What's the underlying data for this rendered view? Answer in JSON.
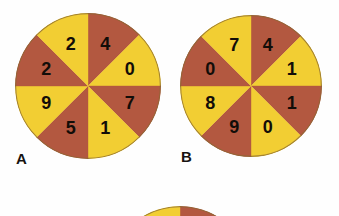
{
  "figure": {
    "background_color": "#fefefe",
    "sector_yellow": "#f2ce33",
    "sector_red": "#b35840",
    "outline_color": "#8a6a34",
    "label_color": "#120d08"
  },
  "spinners": [
    {
      "caption": "A",
      "center_x": 88,
      "center_y": 86,
      "radius": 73,
      "sector_count": 8,
      "sectors": [
        {
          "index": 0,
          "start_angle": 0,
          "end_angle": 45,
          "color": "#b35840",
          "value": "4"
        },
        {
          "index": 1,
          "start_angle": 45,
          "end_angle": 90,
          "color": "#f2ce33",
          "value": "0"
        },
        {
          "index": 2,
          "start_angle": 90,
          "end_angle": 135,
          "color": "#b35840",
          "value": "7"
        },
        {
          "index": 3,
          "start_angle": 135,
          "end_angle": 180,
          "color": "#f2ce33",
          "value": "1"
        },
        {
          "index": 4,
          "start_angle": 180,
          "end_angle": 225,
          "color": "#b35840",
          "value": "5"
        },
        {
          "index": 5,
          "start_angle": 225,
          "end_angle": 270,
          "color": "#f2ce33",
          "value": "9"
        },
        {
          "index": 6,
          "start_angle": 270,
          "end_angle": 315,
          "color": "#b35840",
          "value": "2"
        },
        {
          "index": 7,
          "start_angle": 315,
          "end_angle": 360,
          "color": "#f2ce33",
          "value": "2"
        }
      ]
    },
    {
      "caption": "B",
      "center_x": 251,
      "center_y": 86,
      "radius": 71,
      "sector_count": 8,
      "sectors": [
        {
          "index": 0,
          "start_angle": 0,
          "end_angle": 45,
          "color": "#b35840",
          "value": "4"
        },
        {
          "index": 1,
          "start_angle": 45,
          "end_angle": 90,
          "color": "#f2ce33",
          "value": "1"
        },
        {
          "index": 2,
          "start_angle": 90,
          "end_angle": 135,
          "color": "#b35840",
          "value": "1"
        },
        {
          "index": 3,
          "start_angle": 135,
          "end_angle": 180,
          "color": "#f2ce33",
          "value": "0"
        },
        {
          "index": 4,
          "start_angle": 180,
          "end_angle": 225,
          "color": "#b35840",
          "value": "9"
        },
        {
          "index": 5,
          "start_angle": 225,
          "end_angle": 270,
          "color": "#f2ce33",
          "value": "8"
        },
        {
          "index": 6,
          "start_angle": 270,
          "end_angle": 315,
          "color": "#b35840",
          "value": "0"
        },
        {
          "index": 7,
          "start_angle": 315,
          "end_angle": 360,
          "color": "#f2ce33",
          "value": "7"
        }
      ]
    },
    {
      "caption": "",
      "center_x": 180,
      "center_y": 278,
      "radius": 72,
      "sector_count": 8,
      "partially_visible": true,
      "sectors": [
        {
          "index": 0,
          "start_angle": 0,
          "end_angle": 45,
          "color": "#b35840",
          "value": ""
        },
        {
          "index": 1,
          "start_angle": 45,
          "end_angle": 90,
          "color": "#f2ce33",
          "value": ""
        },
        {
          "index": 2,
          "start_angle": 90,
          "end_angle": 135,
          "color": "#b35840",
          "value": ""
        },
        {
          "index": 3,
          "start_angle": 135,
          "end_angle": 180,
          "color": "#f2ce33",
          "value": ""
        },
        {
          "index": 4,
          "start_angle": 180,
          "end_angle": 225,
          "color": "#b35840",
          "value": ""
        },
        {
          "index": 5,
          "start_angle": 225,
          "end_angle": 270,
          "color": "#f2ce33",
          "value": ""
        },
        {
          "index": 6,
          "start_angle": 270,
          "end_angle": 315,
          "color": "#b35840",
          "value": ""
        },
        {
          "index": 7,
          "start_angle": 315,
          "end_angle": 360,
          "color": "#f2ce33",
          "value": ""
        }
      ]
    }
  ]
}
